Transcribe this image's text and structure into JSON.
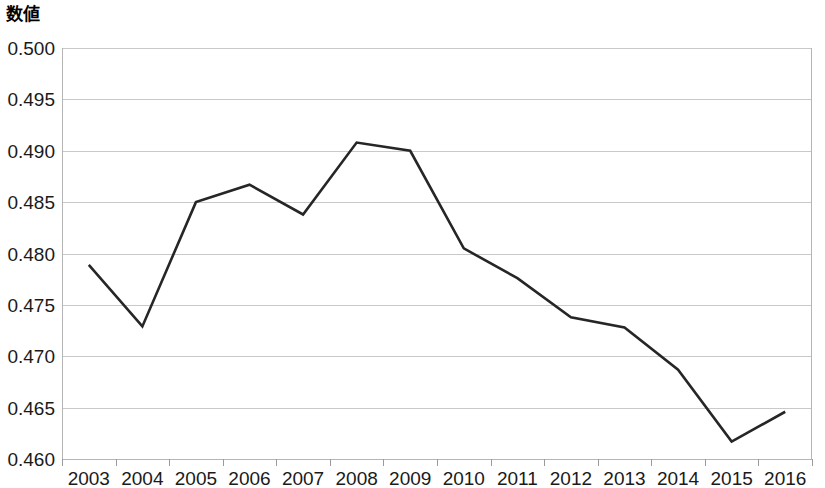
{
  "chart_data": {
    "type": "line",
    "title": "数値",
    "xlabel": "",
    "ylabel": "数値",
    "categories": [
      "2003",
      "2004",
      "2005",
      "2006",
      "2007",
      "2008",
      "2009",
      "2010",
      "2011",
      "2012",
      "2013",
      "2014",
      "2015",
      "2016"
    ],
    "values": [
      0.4789,
      0.4729,
      0.485,
      0.4867,
      0.4838,
      0.4908,
      0.49,
      0.4805,
      0.4776,
      0.4738,
      0.4728,
      0.4687,
      0.4617,
      0.4646
    ],
    "series": [
      {
        "name": "数値",
        "values": [
          0.4789,
          0.4729,
          0.485,
          0.4867,
          0.4838,
          0.4908,
          0.49,
          0.4805,
          0.4776,
          0.4738,
          0.4728,
          0.4687,
          0.4617,
          0.4646
        ]
      }
    ],
    "ylim": [
      0.46,
      0.5
    ],
    "ytick_labels": [
      "0.500",
      "0.495",
      "0.490",
      "0.485",
      "0.480",
      "0.475",
      "0.470",
      "0.465",
      "0.460"
    ],
    "ytick_values": [
      0.5,
      0.495,
      0.49,
      0.485,
      0.48,
      0.475,
      0.47,
      0.465,
      0.46
    ],
    "ytick_step": 0.005,
    "grid": true,
    "legend": "none",
    "line_color": "#262626",
    "grid_color": "#c9c9c9",
    "axis_color": "#b5b5b5",
    "background_color": "#ffffff"
  },
  "plot_geometry": {
    "left": 62,
    "right": 812,
    "top": 48,
    "bottom": 459
  }
}
